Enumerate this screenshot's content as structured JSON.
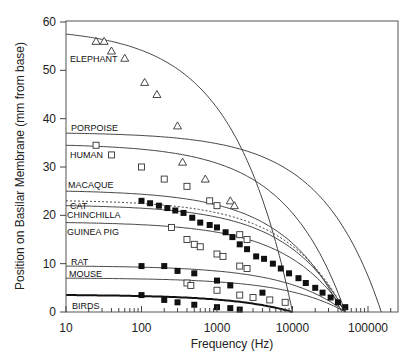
{
  "chart_data": {
    "type": "scatter",
    "title": "",
    "xlabel": "Frequency (Hz)",
    "ylabel": "Position on Basilar Membrane (mm from base)",
    "xscale": "log",
    "xlim": [
      10,
      200000
    ],
    "ylim": [
      0,
      60
    ],
    "x_ticks": [
      "10",
      "100",
      "1000",
      "10000",
      "100000"
    ],
    "y_ticks": [
      "0",
      "10",
      "20",
      "30",
      "40",
      "50",
      "60"
    ],
    "grid": false,
    "legend": "inline labels",
    "series": [
      {
        "name": "ELEPHANT",
        "marker": "open-triangle",
        "curve_start": 57.5,
        "curve_end_hz": 10000,
        "points": [
          [
            25,
            56
          ],
          [
            32,
            56
          ],
          [
            40,
            54
          ],
          [
            60,
            52.5
          ],
          [
            110,
            47.5
          ],
          [
            160,
            45
          ],
          [
            300,
            38.5
          ],
          [
            350,
            31
          ],
          [
            700,
            27.5
          ],
          [
            1500,
            23
          ],
          [
            1700,
            22
          ]
        ]
      },
      {
        "name": "PORPOISE",
        "marker": "none",
        "curve_start": 37,
        "curve_end_hz": 150000,
        "points": []
      },
      {
        "name": "HUMAN",
        "marker": "open-square",
        "curve_start": 34.5,
        "curve_end_hz": 50000,
        "points": [
          [
            25,
            34.5
          ],
          [
            40,
            32.5
          ],
          [
            100,
            30
          ],
          [
            200,
            27.5
          ],
          [
            400,
            26
          ],
          [
            800,
            23
          ],
          [
            1000,
            22
          ],
          [
            2000,
            16
          ],
          [
            2500,
            15
          ]
        ]
      },
      {
        "name": "MACAQUE",
        "marker": "none",
        "curve_start": 25,
        "curve_end_hz": 45000,
        "points": []
      },
      {
        "name": "CAT",
        "marker": "filled-square",
        "curve_start": 23,
        "curve_end_hz": 50000,
        "dashed": true,
        "points": [
          [
            100,
            23
          ],
          [
            130,
            22.5
          ],
          [
            170,
            22
          ],
          [
            220,
            21.5
          ],
          [
            280,
            21
          ],
          [
            360,
            20.5
          ],
          [
            470,
            19.5
          ],
          [
            600,
            18.5
          ],
          [
            800,
            18
          ],
          [
            1000,
            17.5
          ],
          [
            1300,
            16.5
          ],
          [
            1600,
            15.5
          ],
          [
            2000,
            14
          ],
          [
            2500,
            13
          ],
          [
            3300,
            11.5
          ],
          [
            4200,
            11
          ],
          [
            5500,
            10
          ],
          [
            7000,
            9
          ],
          [
            9000,
            8
          ],
          [
            12000,
            7
          ],
          [
            15000,
            6
          ],
          [
            20000,
            5
          ],
          [
            25000,
            4
          ],
          [
            32000,
            3
          ],
          [
            40000,
            2
          ],
          [
            50000,
            1
          ]
        ]
      },
      {
        "name": "CHINCHILLA",
        "marker": "none",
        "curve_start": 22,
        "curve_end_hz": 50000,
        "points": []
      },
      {
        "name": "GUINEA PIG",
        "marker": "open-square",
        "curve_start": 18.5,
        "curve_end_hz": 50000,
        "points": [
          [
            250,
            17.5
          ],
          [
            400,
            15
          ],
          [
            500,
            14
          ],
          [
            600,
            13.5
          ],
          [
            1000,
            12
          ],
          [
            1200,
            11.5
          ],
          [
            2000,
            9.5
          ],
          [
            2500,
            9
          ]
        ]
      },
      {
        "name": "RAT",
        "marker": "filled-square",
        "curve_start": 9.5,
        "curve_end_hz": 50000,
        "points": [
          [
            100,
            9.5
          ],
          [
            200,
            9.5
          ],
          [
            300,
            8.5
          ],
          [
            500,
            8
          ],
          [
            1000,
            6.5
          ],
          [
            1500,
            5.5
          ],
          [
            4000,
            4
          ]
        ]
      },
      {
        "name": "MOUSE",
        "marker": "open-square",
        "curve_start": 7,
        "curve_end_hz": 50000,
        "points": [
          [
            400,
            6
          ],
          [
            450,
            5.5
          ],
          [
            1000,
            4.5
          ],
          [
            2000,
            3.5
          ],
          [
            3000,
            3
          ],
          [
            5000,
            2.5
          ],
          [
            8000,
            2
          ]
        ]
      },
      {
        "name": "BIRDS",
        "marker": "filled-square",
        "curve_start": 3.5,
        "curve_end_hz": 10000,
        "points": [
          [
            100,
            3.5
          ],
          [
            200,
            2.5
          ],
          [
            300,
            2
          ],
          [
            500,
            1.5
          ],
          [
            1000,
            1
          ],
          [
            1500,
            0.8
          ],
          [
            2000,
            0.5
          ]
        ]
      }
    ]
  },
  "labels": {
    "elephant": "ELEPHANT",
    "porpoise": "PORPOISE",
    "human": "HUMAN",
    "macaque": "MACAQUE",
    "cat": "CAT",
    "chinchilla": "CHINCHILLA",
    "guinea_pig": "GUINEA PIG",
    "rat": "RAT",
    "mouse": "MOUSE",
    "birds": "BIRDS"
  },
  "axes": {
    "x_title": "Frequency (Hz)",
    "y_title": "Position on Basilar Membrane (mm from base)",
    "x_ticks": [
      "10",
      "100",
      "1000",
      "10000",
      "100000"
    ],
    "y_ticks": [
      "0",
      "10",
      "20",
      "30",
      "40",
      "50",
      "60"
    ]
  }
}
